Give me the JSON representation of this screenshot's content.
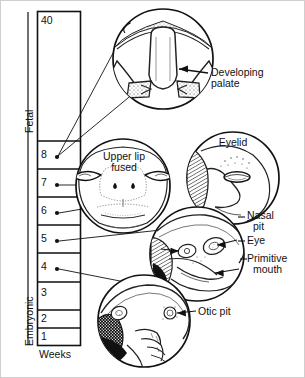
{
  "figure": {
    "background_color": "#ffffff",
    "ink_color": "#111111"
  },
  "timeline": {
    "axis_label": "Weeks",
    "period_labels": [
      {
        "name": "fetal",
        "text": "Fetal"
      },
      {
        "name": "embryonic",
        "text": "Embryonic"
      }
    ],
    "ticks": [
      {
        "value": "40",
        "has_dot": false
      },
      {
        "value": "8",
        "has_dot": true
      },
      {
        "value": "7",
        "has_dot": true
      },
      {
        "value": "6",
        "has_dot": true
      },
      {
        "value": "5",
        "has_dot": true
      },
      {
        "value": "4",
        "has_dot": true
      },
      {
        "value": "3",
        "has_dot": false
      },
      {
        "value": "2",
        "has_dot": false
      },
      {
        "value": "1",
        "has_dot": false
      }
    ]
  },
  "panels": [
    {
      "id": "palate",
      "name": "developing-palate-panel",
      "inner_label": "",
      "callout": "Developing\npalate",
      "linked_week": "8"
    },
    {
      "id": "upper-lip",
      "name": "upper-lip-fused-panel",
      "inner_label": "Upper lip\nfused",
      "callout": "",
      "linked_week": "7"
    },
    {
      "id": "eyelid",
      "name": "eyelid-panel",
      "inner_label": "Eyelid",
      "callout": "",
      "linked_week": "7"
    },
    {
      "id": "embryo-head",
      "name": "embryonic-head-panel",
      "inner_label": "",
      "callout": "",
      "linked_week": "5"
    },
    {
      "id": "early-embryo",
      "name": "early-embryo-panel",
      "inner_label": "",
      "callout": "",
      "linked_week": "4"
    }
  ],
  "callouts": [
    {
      "name": "developing-palate-label",
      "line1": "Developing",
      "line2": "palate"
    },
    {
      "name": "eyelid-label",
      "line1": "Eyelid",
      "line2": ""
    },
    {
      "name": "nasal-pit-label",
      "line1": "Nasal",
      "line2": "pit"
    },
    {
      "name": "eye-label",
      "line1": "Eye",
      "line2": ""
    },
    {
      "name": "primitive-mouth-label",
      "line1": "Primitive",
      "line2": "mouth"
    },
    {
      "name": "otic-pit-label",
      "line1": "Otic pit",
      "line2": ""
    },
    {
      "name": "upper-lip-fused-label",
      "line1": "Upper lip",
      "line2": "fused"
    }
  ]
}
